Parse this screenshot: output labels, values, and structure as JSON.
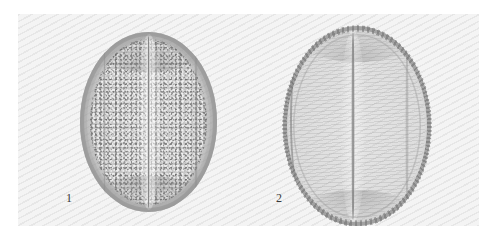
{
  "figure": {
    "kind": "light-micrograph-plate",
    "specimen": "pollen grain",
    "background_color": "#f4f4f4",
    "page_color": "#ffffff",
    "ink_color": "#3a3a3a"
  },
  "panel": {
    "label": "micrograph panel"
  },
  "specimens": [
    {
      "number": "1",
      "name": "pollen-grain-1",
      "surface": "granular / scabrate exine",
      "aperture": "single median colpus",
      "outline": "oval",
      "tone": "#a8a8a8"
    },
    {
      "number": "2",
      "name": "pollen-grain-2",
      "surface": "smooth with finely beaded outer wall",
      "aperture": "single median colpus",
      "outline": "oval",
      "tone": "#bcbcbc"
    }
  ],
  "labels": {
    "fig1": "1",
    "fig2": "2"
  }
}
